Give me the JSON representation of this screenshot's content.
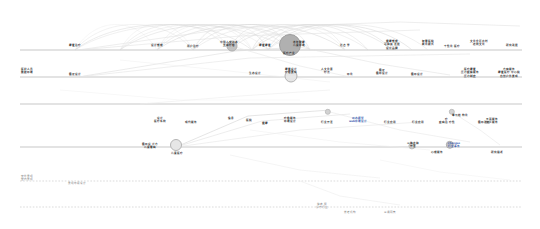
{
  "diagram": {
    "type": "timeline-network",
    "canvas": {
      "width": 540,
      "height": 229
    },
    "colors": {
      "lane_solid": "#b9b9b9",
      "lane_dashed": "#cccccc",
      "arc": "#d8d8d8",
      "node_large": "#b0b0b0",
      "node_medium": "#b6b6b6",
      "node_small": "#c2c2c2",
      "text": "#343434",
      "highlight": "#3b5fb0"
    },
    "lanes": [
      {
        "name": "lane-1",
        "y": 50,
        "style": "solid",
        "x1": 20,
        "x2": 522
      },
      {
        "name": "lane-2",
        "y": 77,
        "style": "solid",
        "x1": 20,
        "x2": 522
      },
      {
        "name": "lane-3",
        "y": 104,
        "style": "solid",
        "x1": 20,
        "x2": 522
      },
      {
        "name": "lane-4",
        "y": 147,
        "style": "solid",
        "x1": 20,
        "x2": 522
      },
      {
        "name": "lane-5",
        "y": 181,
        "style": "dashed",
        "x1": 20,
        "x2": 522
      },
      {
        "name": "lane-6",
        "y": 207,
        "style": "dashed",
        "x1": 20,
        "x2": 522
      }
    ],
    "nodes": [
      {
        "id": "n1",
        "lane": 1,
        "x": 232,
        "y": 46,
        "r": 4.5,
        "size": "sm"
      },
      {
        "id": "n2",
        "lane": 1,
        "x": 290,
        "y": 45,
        "r": 10,
        "size": "lg"
      },
      {
        "id": "n3",
        "lane": 2,
        "x": 291,
        "y": 76,
        "r": 5.5,
        "size": "ring"
      },
      {
        "id": "n4",
        "lane": 3,
        "x": 328,
        "y": 112,
        "r": 2.2,
        "size": "xs"
      },
      {
        "id": "n5",
        "lane": 3,
        "x": 452,
        "y": 112,
        "r": 2.2,
        "size": "xs"
      },
      {
        "id": "n6",
        "lane": 4,
        "x": 176,
        "y": 145,
        "r": 5,
        "size": "ring"
      },
      {
        "id": "n7",
        "lane": 4,
        "x": 412,
        "y": 146,
        "r": 2.6,
        "size": "xs"
      },
      {
        "id": "n8",
        "lane": 4,
        "x": 450,
        "y": 145,
        "r": 3.2,
        "size": "sm"
      }
    ],
    "labels_lane1": [
      {
        "x": 75,
        "y": 44,
        "text": "康复治疗"
      },
      {
        "x": 157,
        "y": 44,
        "text": "设计管理"
      },
      {
        "x": 193,
        "y": 45,
        "text": "用户治疗"
      },
      {
        "x": 229,
        "y": 41,
        "text": "中国人文人本\n支持疗愈"
      },
      {
        "x": 265,
        "y": 44,
        "text": "康复康复"
      },
      {
        "x": 289,
        "y": 52,
        "text": "医疗产业"
      },
      {
        "x": 299,
        "y": 41,
        "text": "老年健康\n儿童环境"
      },
      {
        "x": 345,
        "y": 44,
        "text": "社会学"
      },
      {
        "x": 392,
        "y": 40,
        "text": "健康管理\n可持续发展\n设计品牌"
      },
      {
        "x": 428,
        "y": 40,
        "text": "智慧医院\n新化模式"
      },
      {
        "x": 452,
        "y": 45,
        "text": "个性化医疗"
      },
      {
        "x": 479,
        "y": 40,
        "text": "文化企区农村\n传统文化"
      },
      {
        "x": 512,
        "y": 44,
        "text": "研究进展"
      }
    ],
    "labels_lane2": [
      {
        "x": 27,
        "y": 68,
        "text": "医护人员\n数据环境"
      },
      {
        "x": 75,
        "y": 73,
        "text": "循证设计"
      },
      {
        "x": 255,
        "y": 72,
        "text": "生态设计"
      },
      {
        "x": 291,
        "y": 68,
        "text": "康复设计\n疗愈景观"
      },
      {
        "x": 327,
        "y": 68,
        "text": "人文化素\n疗法"
      },
      {
        "x": 350,
        "y": 73,
        "text": "环化"
      },
      {
        "x": 382,
        "y": 69,
        "text": "循证\n循环设计"
      },
      {
        "x": 417,
        "y": 73,
        "text": "循环设计"
      },
      {
        "x": 470,
        "y": 68,
        "text": "医疗康复\n压力缓解服务\n压力制度"
      },
      {
        "x": 509,
        "y": 68,
        "text": "方案服务\n康复医疗中心院\n自然户外景观"
      }
    ],
    "labels_lane3": [
      {
        "x": 160,
        "y": 117,
        "text": "设计\n医疗系统"
      },
      {
        "x": 191,
        "y": 121,
        "text": "现代服务"
      },
      {
        "x": 231,
        "y": 117,
        "text": "信息"
      },
      {
        "x": 249,
        "y": 119,
        "text": "医院"
      },
      {
        "x": 265,
        "y": 122,
        "text": "健康"
      },
      {
        "x": 290,
        "y": 117,
        "text": "疗愈服务\n环境设计"
      },
      {
        "x": 327,
        "y": 121,
        "text": "行业开发"
      },
      {
        "x": 358,
        "y": 117,
        "text": "动态模型\nweb环境设计"
      },
      {
        "x": 390,
        "y": 121,
        "text": "行业应用"
      },
      {
        "x": 418,
        "y": 121,
        "text": "行业应用"
      },
      {
        "x": 447,
        "y": 118,
        "text": "疗\n疾病治疗性"
      },
      {
        "x": 484,
        "y": 121,
        "text": "循环改良"
      },
      {
        "x": 460,
        "y": 114,
        "text": "单元结构化"
      },
      {
        "x": 492,
        "y": 118,
        "text": "平面服务\n加工服务"
      }
    ],
    "labels_lane4": [
      {
        "x": 150,
        "y": 143,
        "text": "循环设计方\n儿童看病"
      },
      {
        "x": 177,
        "y": 152,
        "text": "儿童医疗"
      },
      {
        "x": 413,
        "y": 142,
        "text": "三体支持\n开发"
      },
      {
        "x": 437,
        "y": 151,
        "text": "心理服务"
      },
      {
        "x": 454,
        "y": 142,
        "text": "changes\n行业事务"
      },
      {
        "x": 497,
        "y": 151,
        "text": "研究描述"
      }
    ],
    "labels_lane5": [
      {
        "x": 27,
        "y": 175,
        "text": "室外景观\n室内景观"
      },
      {
        "x": 77,
        "y": 182,
        "text": "景观环境设计"
      }
    ],
    "labels_lane6": [
      {
        "x": 322,
        "y": 203,
        "text": "健康服\n诊疗行业"
      },
      {
        "x": 350,
        "y": 211,
        "text": "养老机构"
      },
      {
        "x": 390,
        "y": 211,
        "text": "三通网管"
      }
    ],
    "arcs_count": 28,
    "legend": {}
  }
}
